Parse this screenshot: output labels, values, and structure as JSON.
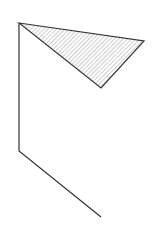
{
  "canvas": {
    "width": 159,
    "height": 244,
    "background": "#ffffff"
  },
  "stroke_color": "#333333",
  "hatch_color": "#888888",
  "shapes": {
    "triangle": {
      "points": "19,23 144,41 101,88",
      "fill": "hatched"
    },
    "polyline": {
      "points": "19,23 19,151 101,217"
    }
  }
}
